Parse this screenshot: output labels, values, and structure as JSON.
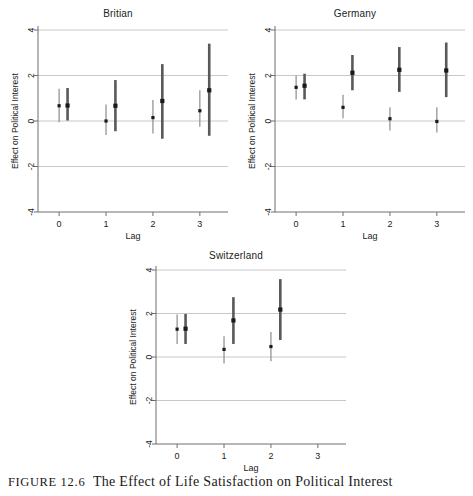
{
  "caption": {
    "label": "FIGURE",
    "number": "12.6",
    "text": "The Effect of Life Satisfaction on Political Interest"
  },
  "axis_common": {
    "ylabel": "Effect on Political Interest",
    "xlabel": "Lag",
    "yticks": [
      "4",
      "2",
      "0",
      "-2",
      "-4"
    ],
    "ytick_values": [
      4,
      2,
      0,
      -2,
      -4
    ],
    "xticks": [
      "0",
      "1",
      "2",
      "3"
    ],
    "xtick_values": [
      0,
      1,
      2,
      3
    ],
    "ylim": [
      -4,
      4
    ],
    "xlim": [
      -0.45,
      3.6
    ],
    "grid": "horizontal",
    "gridlines": [
      4,
      2,
      0,
      -2
    ],
    "legend": "none"
  },
  "colors": {
    "marker": "#1a1a1a",
    "whisker_light": "#8c8c8c",
    "whisker_dark": "#595959",
    "axis": "#6e6e6e",
    "grid": "#c8c8c8",
    "text": "#1c1c1c",
    "caption_text": "#1a1a1a"
  },
  "chart_data": [
    {
      "type": "scatter",
      "title": "Britian",
      "xlabel": "Lag",
      "ylabel": "Effect on Political Interest",
      "ylim": [
        -4,
        4
      ],
      "xlim": [
        -0.45,
        3.6
      ],
      "yticks": [
        4,
        2,
        0,
        -2,
        -4
      ],
      "xticks": [
        0,
        1,
        2,
        3
      ],
      "grid": true,
      "series": [
        {
          "name": "estimate-thin",
          "style": "thin-whisker",
          "points": [
            {
              "x": 0.0,
              "y": 0.67,
              "lo": -0.05,
              "hi": 1.42
            },
            {
              "x": 1.0,
              "y": 0.0,
              "lo": -0.62,
              "hi": 0.72
            },
            {
              "x": 2.0,
              "y": 0.15,
              "lo": -0.55,
              "hi": 0.92
            },
            {
              "x": 3.0,
              "y": 0.45,
              "lo": -0.25,
              "hi": 1.35
            }
          ]
        },
        {
          "name": "estimate-thick",
          "style": "thick-whisker",
          "points": [
            {
              "x": 0.18,
              "y": 0.68,
              "lo": 0.02,
              "hi": 1.45
            },
            {
              "x": 1.2,
              "y": 0.67,
              "lo": -0.45,
              "hi": 1.8
            },
            {
              "x": 2.2,
              "y": 0.88,
              "lo": -0.78,
              "hi": 2.5
            },
            {
              "x": 3.2,
              "y": 1.35,
              "lo": -0.65,
              "hi": 3.4
            }
          ]
        }
      ]
    },
    {
      "type": "scatter",
      "title": "Germany",
      "xlabel": "Lag",
      "ylabel": "Effect on Political Interest",
      "ylim": [
        -4,
        4
      ],
      "xlim": [
        -0.45,
        3.6
      ],
      "yticks": [
        4,
        2,
        0,
        -2,
        -4
      ],
      "xticks": [
        0,
        1,
        2,
        3
      ],
      "grid": true,
      "series": [
        {
          "name": "estimate-thin",
          "style": "thin-whisker",
          "points": [
            {
              "x": 0.0,
              "y": 1.48,
              "lo": 0.95,
              "hi": 2.0
            },
            {
              "x": 1.0,
              "y": 0.6,
              "lo": 0.12,
              "hi": 1.15
            },
            {
              "x": 2.0,
              "y": 0.1,
              "lo": -0.42,
              "hi": 0.6
            },
            {
              "x": 3.0,
              "y": -0.02,
              "lo": -0.5,
              "hi": 0.6
            }
          ]
        },
        {
          "name": "estimate-thick",
          "style": "thick-whisker",
          "points": [
            {
              "x": 0.18,
              "y": 1.55,
              "lo": 0.95,
              "hi": 2.08
            },
            {
              "x": 1.2,
              "y": 2.12,
              "lo": 1.35,
              "hi": 2.9
            },
            {
              "x": 2.2,
              "y": 2.25,
              "lo": 1.28,
              "hi": 3.25
            },
            {
              "x": 3.2,
              "y": 2.22,
              "lo": 1.05,
              "hi": 3.45
            }
          ]
        }
      ]
    },
    {
      "type": "scatter",
      "title": "Switzerland",
      "xlabel": "Lag",
      "ylabel": "Effect on Political Interest",
      "ylim": [
        -4,
        4
      ],
      "xlim": [
        -0.45,
        3.6
      ],
      "yticks": [
        4,
        2,
        0,
        -2,
        -4
      ],
      "xticks": [
        0,
        1,
        2,
        3
      ],
      "grid": true,
      "series": [
        {
          "name": "estimate-thin",
          "style": "thin-whisker",
          "points": [
            {
              "x": 0.0,
              "y": 1.28,
              "lo": 0.6,
              "hi": 1.95
            },
            {
              "x": 1.0,
              "y": 0.35,
              "lo": -0.3,
              "hi": 0.95
            },
            {
              "x": 2.0,
              "y": 0.48,
              "lo": -0.2,
              "hi": 1.15
            }
          ]
        },
        {
          "name": "estimate-thick",
          "style": "thick-whisker",
          "points": [
            {
              "x": 0.18,
              "y": 1.3,
              "lo": 0.6,
              "hi": 1.98
            },
            {
              "x": 1.2,
              "y": 1.68,
              "lo": 0.6,
              "hi": 2.75
            },
            {
              "x": 2.2,
              "y": 2.18,
              "lo": 0.78,
              "hi": 3.58
            }
          ]
        }
      ]
    }
  ],
  "panels": [
    {
      "key": "britian",
      "title": "Britian"
    },
    {
      "key": "germany",
      "title": "Germany"
    },
    {
      "key": "switzerland",
      "title": "Switzerland"
    }
  ]
}
